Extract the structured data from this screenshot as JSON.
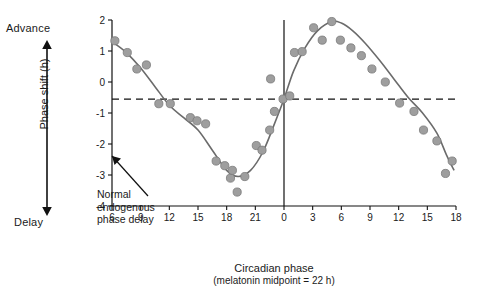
{
  "annotations": {
    "advance": "Advance",
    "delay": "Delay",
    "note_line1": "Normal",
    "note_line2": "endogenous",
    "note_line3": "phase delay"
  },
  "chart_data": {
    "type": "scatter",
    "title": "",
    "xlabel": "Circadian phase",
    "xlabel_sub": "(melatonin midpoint = 22 h)",
    "ylabel": "Phase shift (h)",
    "xlim": [
      6,
      18
    ],
    "ylim": [
      -4,
      2
    ],
    "xticks": [
      "6",
      "9",
      "12",
      "15",
      "18",
      "21",
      "0",
      "3",
      "6",
      "9",
      "12",
      "15",
      "18"
    ],
    "xtick_values": [
      6,
      9,
      12,
      15,
      18,
      21,
      24,
      27,
      30,
      33,
      36,
      39,
      42
    ],
    "yticks": [
      "2",
      "1",
      "0",
      "-1",
      "-2",
      "-3",
      "-4"
    ],
    "ytick_values": [
      2,
      1,
      0,
      -1,
      -2,
      -3,
      -4
    ],
    "grid": false,
    "legend": false,
    "reference_line": {
      "y": -0.55,
      "style": "dashed",
      "label": "Normal endogenous phase delay"
    },
    "vertical_line": {
      "x": 24
    },
    "marker_color": "#9e9e9e",
    "marker_edge_color": "#7a7a7a",
    "curve_color": "#6b6b6b",
    "series": [
      {
        "name": "Phase shift",
        "points": [
          {
            "x": 6.3,
            "y": 1.33
          },
          {
            "x": 7.6,
            "y": 0.95
          },
          {
            "x": 8.6,
            "y": 0.42
          },
          {
            "x": 9.6,
            "y": 0.55
          },
          {
            "x": 10.9,
            "y": -0.7
          },
          {
            "x": 12.1,
            "y": -0.7
          },
          {
            "x": 14.2,
            "y": -1.15
          },
          {
            "x": 14.9,
            "y": -1.25
          },
          {
            "x": 15.8,
            "y": -1.35
          },
          {
            "x": 16.9,
            "y": -2.55
          },
          {
            "x": 17.8,
            "y": -2.7
          },
          {
            "x": 18.4,
            "y": -3.1
          },
          {
            "x": 18.6,
            "y": -2.85
          },
          {
            "x": 19.1,
            "y": -3.55
          },
          {
            "x": 19.9,
            "y": -3.05
          },
          {
            "x": 21.1,
            "y": -2.05
          },
          {
            "x": 21.7,
            "y": -2.2
          },
          {
            "x": 22.5,
            "y": -1.55
          },
          {
            "x": 22.6,
            "y": 0.1
          },
          {
            "x": 23.0,
            "y": -0.95
          },
          {
            "x": 23.9,
            "y": -0.55
          },
          {
            "x": 24.6,
            "y": -0.45
          },
          {
            "x": 25.1,
            "y": 0.95
          },
          {
            "x": 25.9,
            "y": 0.98
          },
          {
            "x": 27.1,
            "y": 1.75
          },
          {
            "x": 28.0,
            "y": 1.35
          },
          {
            "x": 29.0,
            "y": 1.95
          },
          {
            "x": 29.9,
            "y": 1.35
          },
          {
            "x": 31.0,
            "y": 1.1
          },
          {
            "x": 32.1,
            "y": 0.85
          },
          {
            "x": 33.2,
            "y": 0.42
          },
          {
            "x": 34.6,
            "y": 0.0
          },
          {
            "x": 36.1,
            "y": -0.68
          },
          {
            "x": 37.6,
            "y": -0.95
          },
          {
            "x": 38.6,
            "y": -1.55
          },
          {
            "x": 40.0,
            "y": -1.9
          },
          {
            "x": 40.9,
            "y": -2.95
          },
          {
            "x": 41.6,
            "y": -2.55
          }
        ]
      }
    ],
    "fit_curve": [
      {
        "x": 6.0,
        "y": 1.3
      },
      {
        "x": 7.5,
        "y": 0.95
      },
      {
        "x": 9.0,
        "y": 0.45
      },
      {
        "x": 10.5,
        "y": -0.15
      },
      {
        "x": 12.0,
        "y": -0.75
      },
      {
        "x": 13.5,
        "y": -1.15
      },
      {
        "x": 15.0,
        "y": -1.55
      },
      {
        "x": 16.5,
        "y": -2.2
      },
      {
        "x": 18.0,
        "y": -2.85
      },
      {
        "x": 19.2,
        "y": -3.05
      },
      {
        "x": 20.5,
        "y": -2.85
      },
      {
        "x": 21.8,
        "y": -2.25
      },
      {
        "x": 23.0,
        "y": -1.35
      },
      {
        "x": 24.0,
        "y": -0.55
      },
      {
        "x": 25.0,
        "y": 0.35
      },
      {
        "x": 26.2,
        "y": 1.1
      },
      {
        "x": 27.5,
        "y": 1.65
      },
      {
        "x": 29.0,
        "y": 1.95
      },
      {
        "x": 30.0,
        "y": 1.9
      },
      {
        "x": 31.2,
        "y": 1.65
      },
      {
        "x": 32.5,
        "y": 1.25
      },
      {
        "x": 34.0,
        "y": 0.7
      },
      {
        "x": 35.5,
        "y": 0.1
      },
      {
        "x": 37.0,
        "y": -0.5
      },
      {
        "x": 38.5,
        "y": -1.0
      },
      {
        "x": 40.0,
        "y": -1.65
      },
      {
        "x": 41.0,
        "y": -2.35
      },
      {
        "x": 41.8,
        "y": -2.85
      }
    ]
  }
}
